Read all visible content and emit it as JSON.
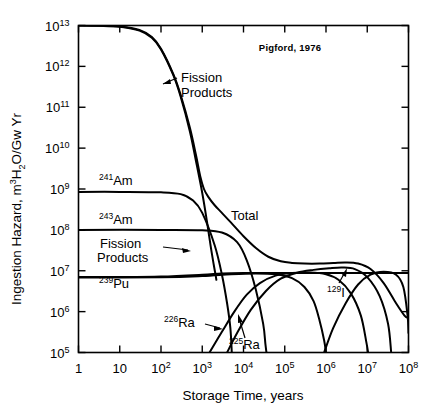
{
  "figure": {
    "credit": "Pigford, 1976",
    "ylabel_main": "Ingestion Hazard, m",
    "ylabel_sup1": "3",
    "ylabel_mid": " H",
    "ylabel_sub": "2",
    "ylabel_tail": "O/Gw Yr",
    "ylabel_full": "Ingestion Hazard, m3 H2O/Gw Yr",
    "xlabel": "Storage Time, years"
  },
  "axes": {
    "x_tick_labels": [
      "1",
      "10",
      "10",
      "10",
      "10",
      "10",
      "10",
      "10",
      "10"
    ],
    "x_tick_sups": [
      "",
      "",
      "2",
      "3",
      "4",
      "5",
      "6",
      "7",
      "8"
    ],
    "x_exponents": [
      0,
      1,
      2,
      3,
      4,
      5,
      6,
      7,
      8
    ],
    "y_tick_labels": [
      "10",
      "10",
      "10",
      "10",
      "10",
      "10",
      "10",
      "10",
      "10"
    ],
    "y_tick_sups": [
      "5",
      "6",
      "7",
      "8",
      "9",
      "10",
      "11",
      "12",
      "13"
    ],
    "y_exponents": [
      5,
      6,
      7,
      8,
      9,
      10,
      11,
      12,
      13
    ]
  },
  "annotations": {
    "fission_products_top": "Fission\nProducts",
    "fission_products_top_line1": "Fission",
    "fission_products_top_line2": "Products",
    "fission_products_low_line1": "Fission",
    "fission_products_low_line2": "Products",
    "total": "Total",
    "am241_sup": "241",
    "am241_base": "Am",
    "am243_sup": "243",
    "am243_base": "Am",
    "pu239_sup": "239",
    "pu239_base": "Pu",
    "ra226_sup": "226",
    "ra226_base": "Ra",
    "ra225_sup": "225",
    "ra225_base": "Ra",
    "i129_sup": "129",
    "i129_base": "I"
  },
  "chart_data": {
    "type": "line",
    "title": "",
    "subtitle": "Pigford, 1976",
    "xlabel": "Storage Time, years",
    "ylabel": "Ingestion Hazard, m3 H2O/Gw Yr",
    "xscale": "log",
    "yscale": "log",
    "xlim": [
      1,
      100000000
    ],
    "ylim": [
      100000,
      10000000000000
    ],
    "grid": false,
    "legend": "inline-annotations",
    "series": [
      {
        "name": "Fission Products (high-activity branch)",
        "label_position": "upper-left-curve",
        "points": [
          [
            1,
            10000000000000.0
          ],
          [
            3,
            9800000000000.0
          ],
          [
            10,
            9300000000000.0
          ],
          [
            30,
            7500000000000.0
          ],
          [
            60,
            5000000000000.0
          ],
          [
            100,
            2600000000000.0
          ],
          [
            200,
            600000000000.0
          ],
          [
            300,
            180000000000.0
          ],
          [
            500,
            26000000000.0
          ],
          [
            700,
            5000000000.0
          ],
          [
            1000,
            800000000.0
          ],
          [
            1300,
            160000000.0
          ],
          [
            1600,
            40000000.0
          ],
          [
            1900,
            14000000.0
          ],
          [
            2100,
            8000000.0
          ],
          [
            2200,
            6000000.0
          ]
        ]
      },
      {
        "name": "Fission Products (long-lived plateau, 129-I bearing)",
        "label_position": "lower-left-inline",
        "points": [
          [
            1,
            7000000.0
          ],
          [
            10,
            7000000.0
          ],
          [
            100,
            7200000.0
          ],
          [
            1000,
            8000000.0
          ],
          [
            3000,
            8600000.0
          ],
          [
            10000,
            8800000.0
          ],
          [
            100000,
            8800000.0
          ],
          [
            1000000,
            8800000.0
          ],
          [
            10000000,
            8800000.0
          ],
          [
            40000000,
            8800000.0
          ],
          [
            100000000,
            8800000.0
          ]
        ]
      },
      {
        "name": "241-Am",
        "label_position": "left-upper",
        "points": [
          [
            1,
            850000000.0
          ],
          [
            10,
            850000000.0
          ],
          [
            100,
            830000000.0
          ],
          [
            300,
            750000000.0
          ],
          [
            600,
            520000000.0
          ],
          [
            1000,
            260000000.0
          ],
          [
            2000,
            42000000.0
          ],
          [
            3000,
            8000000.0
          ],
          [
            4000,
            1600000.0
          ],
          [
            4800,
            400000.0
          ],
          [
            5200,
            100000.0
          ]
        ]
      },
      {
        "name": "243-Am",
        "label_position": "left-mid",
        "points": [
          [
            1,
            100000000.0
          ],
          [
            100,
            100000000.0
          ],
          [
            1000,
            98000000.0
          ],
          [
            3000,
            86000000.0
          ],
          [
            7000,
            50000000.0
          ],
          [
            12000,
            18000000.0
          ],
          [
            20000,
            3400000.0
          ],
          [
            30000,
            500000.0
          ],
          [
            34000,
            160000.0
          ],
          [
            36000,
            100000.0
          ]
        ]
      },
      {
        "name": "239-Pu",
        "label_position": "left-lower",
        "points": [
          [
            1,
            6800000.0
          ],
          [
            100,
            6900000.0
          ],
          [
            1000,
            7400000.0
          ],
          [
            5000,
            8200000.0
          ],
          [
            20000,
            8600000.0
          ],
          [
            60000,
            8200000.0
          ],
          [
            150000,
            6600000.0
          ],
          [
            300000,
            4000000.0
          ],
          [
            500000,
            1800000.0
          ],
          [
            700000,
            600000.0
          ],
          [
            900000,
            200000.0
          ],
          [
            1000000,
            100000.0
          ]
        ]
      },
      {
        "name": "226-Ra",
        "label_position": "lower-mid",
        "points": [
          [
            1500,
            100000.0
          ],
          [
            3000,
            320000.0
          ],
          [
            6000,
            1000000.0
          ],
          [
            12000,
            2600000.0
          ],
          [
            25000,
            5000000.0
          ],
          [
            60000,
            7600000.0
          ],
          [
            150000,
            8800000.0
          ],
          [
            400000,
            9000000.0
          ],
          [
            1000000,
            8200000.0
          ],
          [
            2000000,
            6000000.0
          ],
          [
            4000000,
            2800000.0
          ],
          [
            7000000,
            800000.0
          ],
          [
            9500000,
            180000.0
          ],
          [
            10500000,
            100000.0
          ]
        ]
      },
      {
        "name": "225-Ra",
        "label_position": "lower-mid-right",
        "points": [
          [
            4000,
            100000.0
          ],
          [
            7000,
            300000.0
          ],
          [
            15000,
            1100000.0
          ],
          [
            35000,
            3200000.0
          ],
          [
            80000,
            6400000.0
          ],
          [
            200000,
            9000000.0
          ],
          [
            500000,
            10500000.0
          ],
          [
            1200000,
            11500000.0
          ],
          [
            2500000,
            12000000.0
          ],
          [
            5000000,
            11000000.0
          ],
          [
            10000000,
            7000000.0
          ],
          [
            20000000,
            2400000.0
          ],
          [
            32000000,
            500000.0
          ],
          [
            38000000,
            100000.0
          ]
        ]
      },
      {
        "name": "129-I",
        "label_position": "right-lower",
        "points": [
          [
            900000,
            100000.0
          ],
          [
            1500000,
            400000.0
          ],
          [
            3000000,
            1600000.0
          ],
          [
            6000000,
            4600000.0
          ],
          [
            12000000,
            8000000.0
          ],
          [
            25000000,
            9400000.0
          ],
          [
            50000000,
            8000000.0
          ],
          [
            75000000,
            4000000.0
          ],
          [
            95000000,
            800000.0
          ],
          [
            100000000,
            300000.0
          ]
        ]
      },
      {
        "name": "Total",
        "label_position": "center-upper",
        "points": [
          [
            1,
            10000000000000.0
          ],
          [
            3,
            9900000000000.0
          ],
          [
            10,
            9500000000000.0
          ],
          [
            30,
            7800000000000.0
          ],
          [
            60,
            5200000000000.0
          ],
          [
            100,
            2700000000000.0
          ],
          [
            200,
            640000000000.0
          ],
          [
            300,
            200000000000.0
          ],
          [
            500,
            32000000000.0
          ],
          [
            700,
            7000000000.0
          ],
          [
            900,
            2000000000.0
          ],
          [
            1100,
            1000000000.0
          ],
          [
            1400,
            640000000.0
          ],
          [
            2000,
            400000000.0
          ],
          [
            3000,
            260000000.0
          ],
          [
            5000,
            150000000.0
          ],
          [
            10000,
            70000000.0
          ],
          [
            20000,
            36000000.0
          ],
          [
            40000,
            22000000.0
          ],
          [
            80000,
            17000000.0
          ],
          [
            150000,
            15500000.0
          ],
          [
            300000,
            15000000.0
          ],
          [
            700000,
            15000000.0
          ],
          [
            1500000,
            15500000.0
          ],
          [
            3000000,
            16000000.0
          ],
          [
            6000000,
            15000000.0
          ],
          [
            12000000,
            11000000.0
          ],
          [
            25000000,
            5000000.0
          ],
          [
            50000000,
            1600000.0
          ],
          [
            80000000,
            800000.0
          ],
          [
            100000000,
            700000.0
          ]
        ]
      }
    ]
  }
}
